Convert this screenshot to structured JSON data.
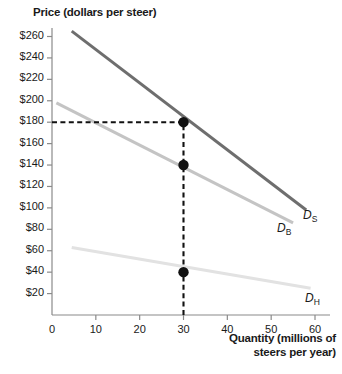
{
  "chart_data": {
    "type": "line",
    "title": "Price (dollars per steer)",
    "ylabel": "Price (dollars per steer)",
    "xlabel": "Quantity (millions of steers per year)",
    "xlabel_line1": "Quantity (millions of",
    "xlabel_line2": "steers per year)",
    "xlim": [
      0,
      63
    ],
    "ylim": [
      0,
      270
    ],
    "grid": false,
    "legend": "inline-curve-labels",
    "yticks": [
      20,
      40,
      60,
      80,
      100,
      120,
      140,
      160,
      180,
      200,
      220,
      240,
      260
    ],
    "ytick_labels": [
      "$20",
      "$40",
      "$60",
      "$80",
      "$100",
      "$120",
      "$140",
      "$160",
      "$180",
      "$200",
      "$220",
      "$240",
      "$260"
    ],
    "xticks": [
      0,
      10,
      20,
      30,
      40,
      50,
      60
    ],
    "xtick_labels": [
      "0",
      "10",
      "20",
      "30",
      "40",
      "50",
      "60"
    ],
    "series": [
      {
        "name": "D_S",
        "label": "D",
        "sub": "S",
        "color": "#6e6e6e",
        "width": 3.0,
        "x": [
          4.5,
          58.0
        ],
        "y": [
          265,
          98
        ]
      },
      {
        "name": "D_B",
        "label": "D",
        "sub": "B",
        "color": "#c4c4c4",
        "width": 3.0,
        "x": [
          1.0,
          55.0
        ],
        "y": [
          198,
          86
        ]
      },
      {
        "name": "D_H",
        "label": "D",
        "sub": "H",
        "color": "#e2e2e2",
        "width": 3.0,
        "x": [
          4.5,
          59.0
        ],
        "y": [
          63,
          25
        ]
      }
    ],
    "points": [
      {
        "x": 30,
        "y": 180,
        "on": "D_S",
        "color": "#111111",
        "r": 5.2
      },
      {
        "x": 30,
        "y": 140,
        "on": "D_B",
        "color": "#111111",
        "r": 5.2
      },
      {
        "x": 30,
        "y": 40,
        "on": "D_H",
        "color": "#111111",
        "r": 5.2
      }
    ],
    "guides": [
      {
        "type": "horizontal",
        "value": 180,
        "from_x": 0,
        "to_x": 30,
        "style": "dashed",
        "color": "#111111"
      },
      {
        "type": "vertical",
        "value": 30,
        "from_y": 0,
        "to_y": 180,
        "style": "dashed",
        "color": "#111111"
      }
    ],
    "axis_color": "#8a8a8a"
  },
  "curve_labels": {
    "ds": {
      "base": "D",
      "sub": "S"
    },
    "db": {
      "base": "D",
      "sub": "B"
    },
    "dh": {
      "base": "D",
      "sub": "H"
    }
  }
}
